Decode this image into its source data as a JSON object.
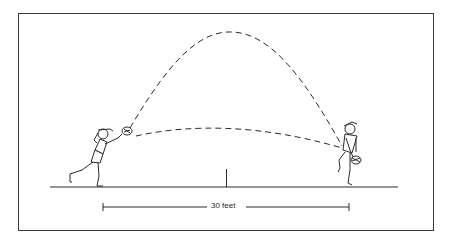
{
  "diagram": {
    "title": "",
    "distance_label": "30 feet",
    "elements": [
      {
        "name": "left-player",
        "role": "hitter swinging racquet"
      },
      {
        "name": "right-player",
        "role": "receiver with racquet held low"
      },
      {
        "name": "high-arc-trajectory",
        "style": "dashed"
      },
      {
        "name": "low-arc-trajectory",
        "style": "dashed"
      },
      {
        "name": "ground-line"
      },
      {
        "name": "center-mark"
      },
      {
        "name": "distance-dimension",
        "label": "30 feet"
      }
    ],
    "colors": {
      "ink": "#2a2a2a",
      "background": "#ffffff",
      "border": "#3a3a3a"
    }
  }
}
